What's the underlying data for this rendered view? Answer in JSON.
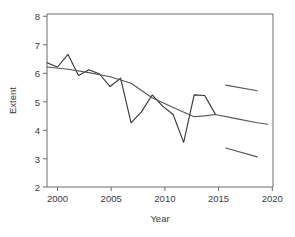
{
  "chart_data": {
    "type": "line",
    "title": "",
    "xlabel": "Year",
    "ylabel": "Extent",
    "xlim": [
      1999,
      2020.5
    ],
    "ylim": [
      2,
      8.2
    ],
    "xticks": [
      2000,
      2005,
      2010,
      2015,
      2020
    ],
    "yticks": [
      2,
      3,
      4,
      5,
      6,
      7,
      8
    ],
    "grid": false,
    "legend": "none",
    "series": [
      {
        "name": "Observed extent",
        "type": "line",
        "color": "#333333",
        "x": [
          1999,
          2000,
          2001,
          2002,
          2003,
          2004,
          2005,
          2006,
          2007,
          2008,
          2009,
          2010,
          2011,
          2012,
          2013,
          2014,
          2015
        ],
        "values": [
          6.45,
          6.3,
          6.75,
          6.0,
          6.2,
          6.05,
          5.6,
          5.9,
          4.3,
          4.7,
          5.3,
          4.9,
          4.6,
          3.6,
          5.3,
          5.28,
          4.62
        ]
      },
      {
        "name": "Fitted trend",
        "type": "line",
        "color": "#555555",
        "x": [
          1999,
          2001,
          2003,
          2005,
          2007,
          2009,
          2011,
          2013,
          2014,
          2015,
          2017,
          2019,
          2020
        ],
        "values": [
          6.3,
          6.22,
          6.1,
          5.95,
          5.72,
          5.2,
          4.85,
          4.52,
          4.55,
          4.6,
          4.45,
          4.3,
          4.25
        ]
      },
      {
        "name": "Upper prediction bound",
        "type": "line",
        "color": "#555555",
        "x": [
          2016,
          2019
        ],
        "values": [
          5.65,
          5.45
        ]
      },
      {
        "name": "Lower prediction bound",
        "type": "line",
        "color": "#555555",
        "x": [
          2016,
          2019
        ],
        "values": [
          3.4,
          3.08
        ]
      }
    ]
  },
  "axes": {
    "y_title": "Extent",
    "x_title": "Year",
    "y_tick_labels": [
      "8",
      "7",
      "6",
      "5",
      "4",
      "3",
      "2"
    ],
    "x_tick_labels": [
      "2000",
      "2005",
      "2010",
      "2015",
      "2020"
    ]
  },
  "colors": {
    "observed": "#333333",
    "trend": "#555555",
    "axis": "#6b6b6b",
    "text": "#3a3a3a",
    "background": "#ffffff"
  }
}
